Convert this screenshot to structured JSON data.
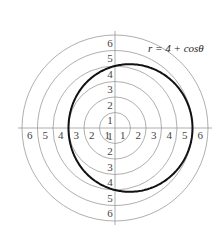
{
  "figure": {
    "equation_label": "r = 4 + cosθ",
    "ring_labels": [
      "1",
      "2",
      "3",
      "4",
      "5",
      "6"
    ],
    "colors": {
      "grid": "#9a9a9a",
      "curve": "#111111",
      "text": "#444444"
    }
  },
  "chart_data": {
    "type": "polar",
    "title": "",
    "curve": {
      "name": "r = 4 + cosθ",
      "equation": "r = 4 + cos(theta)",
      "r_max": 5,
      "r_min": 3
    },
    "grid": {
      "rings": [
        1,
        2,
        3,
        4,
        5,
        6
      ],
      "axes": [
        "horizontal",
        "vertical"
      ]
    },
    "axis_tick_labels": {
      "right": [
        "1",
        "2",
        "3",
        "4",
        "5",
        "6"
      ],
      "left": [
        "1",
        "2",
        "3",
        "4",
        "5",
        "6"
      ],
      "up": [
        "1",
        "2",
        "3",
        "4",
        "5",
        "6"
      ],
      "down": [
        "1",
        "2",
        "3",
        "4",
        "5",
        "6"
      ]
    },
    "rlim": [
      0,
      6
    ]
  }
}
